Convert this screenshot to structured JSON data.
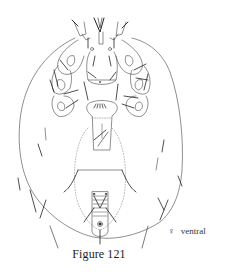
{
  "figure": {
    "caption": "Figure 121",
    "view": {
      "symbol": "♀",
      "label": "ventral"
    },
    "colors": {
      "background": "#ffffff",
      "line": "#444444",
      "dark_line": "#222222",
      "dotted": "#888888"
    }
  }
}
